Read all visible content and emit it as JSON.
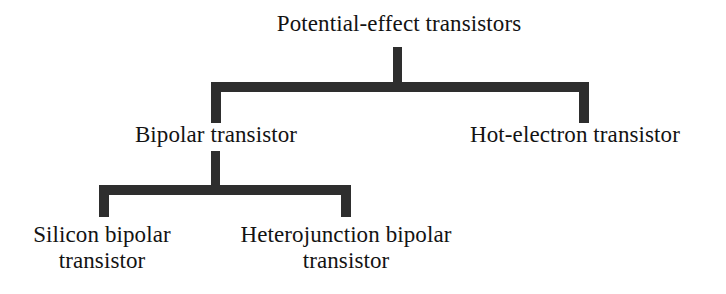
{
  "diagram": {
    "title": "Potential-effect transistors",
    "stroke_color": "#2e2e2e",
    "text_color": "#131313",
    "background_color": "#ffffff",
    "levels": [
      {
        "level": 1,
        "nodes": [
          {
            "id": "root",
            "label": "Potential-effect transistors"
          }
        ]
      },
      {
        "level": 2,
        "nodes": [
          {
            "id": "bipolar",
            "label": "Bipolar transistor"
          },
          {
            "id": "hot-electron",
            "label": "Hot-electron transistor"
          }
        ]
      },
      {
        "level": 3,
        "nodes": [
          {
            "id": "silicon-bipolar",
            "label_line1": "Silicon bipolar",
            "label_line2": "transistor"
          },
          {
            "id": "heterojunction-bipolar",
            "label_line1": "Heterojunction bipolar",
            "label_line2": "transistor"
          }
        ]
      }
    ],
    "edges": [
      {
        "from": "root",
        "to": "bipolar"
      },
      {
        "from": "root",
        "to": "hot-electron"
      },
      {
        "from": "bipolar",
        "to": "silicon-bipolar"
      },
      {
        "from": "bipolar",
        "to": "heterojunction-bipolar"
      }
    ]
  }
}
